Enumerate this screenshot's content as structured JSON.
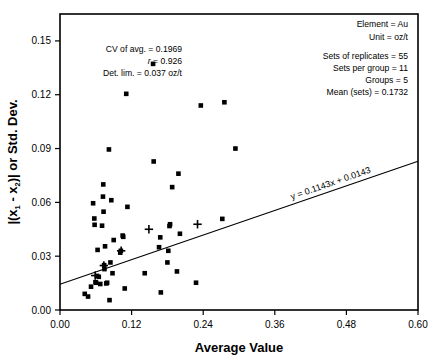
{
  "chart_data": {
    "type": "scatter",
    "title": "",
    "xlabel": "Average Value",
    "ylabel": "|(x1 - x2)| or Std. Dev.",
    "xlim": [
      0.0,
      0.6
    ],
    "ylim": [
      0.0,
      0.165
    ],
    "xticks": [
      0.0,
      0.12,
      0.24,
      0.36,
      0.48,
      0.6
    ],
    "xtick_labels": [
      "0.00",
      "0.12",
      "0.24",
      "0.36",
      "0.48",
      "0.60"
    ],
    "yticks": [
      0.0,
      0.03,
      0.06,
      0.09,
      0.12,
      0.15
    ],
    "ytick_labels": [
      "0.00",
      "0.03",
      "0.06",
      "0.09",
      "0.12",
      "0.15"
    ],
    "grid": false,
    "legend": "none",
    "series": [
      {
        "name": "replicate-pairs",
        "marker": "square",
        "color": "#000000",
        "points": [
          [
            0.0415,
            0.009
          ],
          [
            0.047,
            0.0075
          ],
          [
            0.052,
            0.013
          ],
          [
            0.0555,
            0.0595
          ],
          [
            0.0575,
            0.051
          ],
          [
            0.058,
            0.0475
          ],
          [
            0.0595,
            0.0155
          ],
          [
            0.0605,
            0.0152
          ],
          [
            0.062,
            0.019
          ],
          [
            0.063,
            0.0335
          ],
          [
            0.065,
            0.0185
          ],
          [
            0.0675,
            0.0145
          ],
          [
            0.0705,
            0.047
          ],
          [
            0.072,
            0.0632
          ],
          [
            0.0725,
            0.07
          ],
          [
            0.073,
            0.0548
          ],
          [
            0.074,
            0.025
          ],
          [
            0.0745,
            0.0228
          ],
          [
            0.0755,
            0.0355
          ],
          [
            0.0775,
            0.0148
          ],
          [
            0.079,
            0.0152
          ],
          [
            0.082,
            0.0895
          ],
          [
            0.083,
            0.0055
          ],
          [
            0.0845,
            0.0265
          ],
          [
            0.086,
            0.0612
          ],
          [
            0.088,
            0.0205
          ],
          [
            0.09,
            0.039
          ],
          [
            0.101,
            0.032
          ],
          [
            0.102,
            0.033
          ],
          [
            0.105,
            0.0415
          ],
          [
            0.106,
            0.0408
          ],
          [
            0.1085,
            0.012
          ],
          [
            0.111,
            0.1205
          ],
          [
            0.113,
            0.0575
          ],
          [
            0.142,
            0.0205
          ],
          [
            0.156,
            0.1372
          ],
          [
            0.157,
            0.0828
          ],
          [
            0.166,
            0.035
          ],
          [
            0.168,
            0.0405
          ],
          [
            0.169,
            0.0098
          ],
          [
            0.18,
            0.0265
          ],
          [
            0.1815,
            0.033
          ],
          [
            0.1835,
            0.0468
          ],
          [
            0.1845,
            0.0478
          ],
          [
            0.188,
            0.0685
          ],
          [
            0.196,
            0.0215
          ],
          [
            0.1985,
            0.076
          ],
          [
            0.201,
            0.0425
          ],
          [
            0.228,
            0.0152
          ],
          [
            0.236,
            0.114
          ],
          [
            0.272,
            0.0508
          ],
          [
            0.2755,
            0.1158
          ],
          [
            0.294,
            0.09
          ]
        ]
      },
      {
        "name": "group-means",
        "marker": "plus",
        "color": "#000000",
        "points": [
          [
            0.059,
            0.0192
          ],
          [
            0.0735,
            0.0248
          ],
          [
            0.1025,
            0.033
          ],
          [
            0.149,
            0.045
          ],
          [
            0.2305,
            0.0478
          ]
        ]
      }
    ],
    "fit_line": {
      "label": "y = 0.1143x + 0.0143",
      "slope": 0.1143,
      "intercept": 0.0143,
      "x_start": 0.0,
      "x_end": 0.6,
      "rotated": true
    },
    "annotations_left": [
      {
        "label": "CV of avg. = 0.1969",
        "italic_prefix": ""
      },
      {
        "label": "r = 0.926",
        "italic_prefix": "r"
      },
      {
        "label": "Det. lim. = 0.037 oz/t",
        "italic_prefix": ""
      }
    ],
    "annotations_right": [
      "Element = Au",
      "Unit = oz/t",
      "",
      "Sets of replicates = 55",
      "Sets per group = 11",
      "Groups = 5",
      "Mean (sets) = 0.1732"
    ]
  },
  "axes": {
    "x_title": "Average Value",
    "y_title_parts": {
      "prefix": "|(x",
      "sub1": "1",
      "mid": " - x",
      "sub2": "2",
      "suffix": ")| or Std. Dev."
    }
  },
  "annotations": {
    "left": {
      "cv": "CV of avg.  =  0.1969",
      "r_symbol": "r",
      "r_value": "  =  0.926",
      "det_lim": "Det. lim.  =  0.037 oz/t"
    },
    "right": {
      "element": "Element  =  Au",
      "unit": "Unit  =  oz/t",
      "sets_of_replicates": "Sets of replicates  =  55",
      "sets_per_group": "Sets per group  =  11",
      "groups": "Groups  =  5",
      "mean_sets": "Mean (sets)  =  0.1732"
    },
    "fit_equation": "y = 0.1143x + 0.0143"
  },
  "ticks": {
    "x": [
      "0.00",
      "0.12",
      "0.24",
      "0.36",
      "0.48",
      "0.60"
    ],
    "y": [
      "0.00",
      "0.03",
      "0.06",
      "0.09",
      "0.12",
      "0.15"
    ]
  },
  "colors": {
    "marker": "#000000",
    "axis": "#000000",
    "background": "#ffffff"
  }
}
